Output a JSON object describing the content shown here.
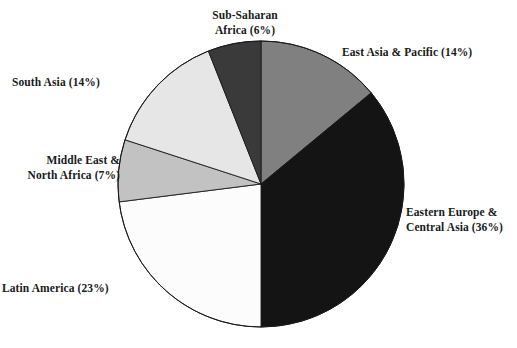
{
  "chart_data": {
    "type": "pie",
    "title": "",
    "subtitle": "",
    "xlabel": "",
    "ylabel": "",
    "legend_position": "outside-labels",
    "grid": false,
    "start_angle_deg": 0,
    "direction": "clockwise",
    "unit": "%",
    "categories": [
      "East Asia & Pacific",
      "Eastern Europe & Central Asia",
      "Latin America",
      "Middle East & North Africa",
      "South Asia",
      "Sub-Saharan Africa"
    ],
    "values": [
      14,
      36,
      23,
      7,
      14,
      6
    ],
    "slices": [
      {
        "name": "east-asia-pacific",
        "label": "East Asia & Pacific (14%)",
        "category": "East Asia & Pacific",
        "value": 14,
        "color": "#808080",
        "stroke": "#1a1a1a"
      },
      {
        "name": "eastern-europe-central-asia",
        "label": "Eastern Europe &\nCentral Asia (36%)",
        "category": "Eastern Europe & Central Asia",
        "value": 36,
        "color": "#141414",
        "stroke": "#1a1a1a"
      },
      {
        "name": "latin-america",
        "label": "Latin America (23%)",
        "category": "Latin America",
        "value": 23,
        "color": "#fcfcfc",
        "stroke": "#1a1a1a"
      },
      {
        "name": "middle-east-north-africa",
        "label": "Middle East &\nNorth Africa (7%)",
        "category": "Middle East & North Africa",
        "value": 7,
        "color": "#c2c2c2",
        "stroke": "#1a1a1a"
      },
      {
        "name": "south-asia",
        "label": "South Asia (14%)",
        "category": "South Asia",
        "value": 14,
        "color": "#e6e6e6",
        "stroke": "#1a1a1a"
      },
      {
        "name": "sub-saharan-africa",
        "label": "Sub-Saharan\nAfrica (6%)",
        "category": "Sub-Saharan Africa",
        "value": 6,
        "color": "#3a3a3a",
        "stroke": "#1a1a1a"
      }
    ],
    "colors": {
      "background": "#ffffff",
      "text": "#1a1a1a",
      "outline": "#1a1a1a"
    }
  },
  "geometry": {
    "center_x": 261,
    "center_y": 184,
    "radius": 143
  }
}
